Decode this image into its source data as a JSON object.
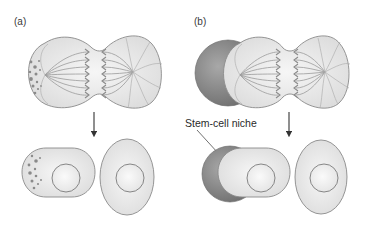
{
  "figure": {
    "panel_a": {
      "label": "(a)"
    },
    "panel_b": {
      "label": "(b)",
      "niche_label": "Stem-cell niche"
    }
  },
  "colors": {
    "background": "#ffffff",
    "cell_fill": "#e8e8e8",
    "cell_stroke": "#8a8a8a",
    "niche_fill": "#8c8c8c",
    "particle": "#8a8a8a",
    "arrow": "#333333"
  }
}
